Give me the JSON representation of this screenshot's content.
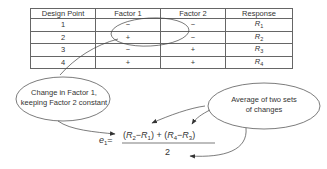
{
  "table": {
    "headers": [
      "Design Point",
      "Factor 1",
      "Factor 2",
      "Response"
    ],
    "rows": [
      {
        "point": "1",
        "f1": "−",
        "f2": "−",
        "resp": "R",
        "resp_sub": "1"
      },
      {
        "point": "2",
        "f1": "+",
        "f2": "−",
        "resp": "R",
        "resp_sub": "2"
      },
      {
        "point": "3",
        "f1": "−",
        "f2": "+",
        "resp": "R",
        "resp_sub": "3"
      },
      {
        "point": "4",
        "f1": "+",
        "f2": "+",
        "resp": "R",
        "resp_sub": "4"
      }
    ]
  },
  "callouts": {
    "left": {
      "line1": "Change in Factor 1,",
      "line2": "keeping Factor 2 constant"
    },
    "right": {
      "line1": "Average of two sets",
      "line2": "of changes"
    }
  },
  "equation": {
    "lhs": "e",
    "lhs_sub": "1",
    "equals": "=",
    "numerator": {
      "open1": "(",
      "a": "R",
      "a_sub": "2",
      "minus1": "−",
      "b": "R",
      "b_sub": "1",
      "close1": ")",
      "plus": " + ",
      "open2": "(",
      "c": "R",
      "c_sub": "4",
      "minus2": "−",
      "d": "R",
      "d_sub": "3",
      "close2": ")"
    },
    "denominator": "2"
  }
}
